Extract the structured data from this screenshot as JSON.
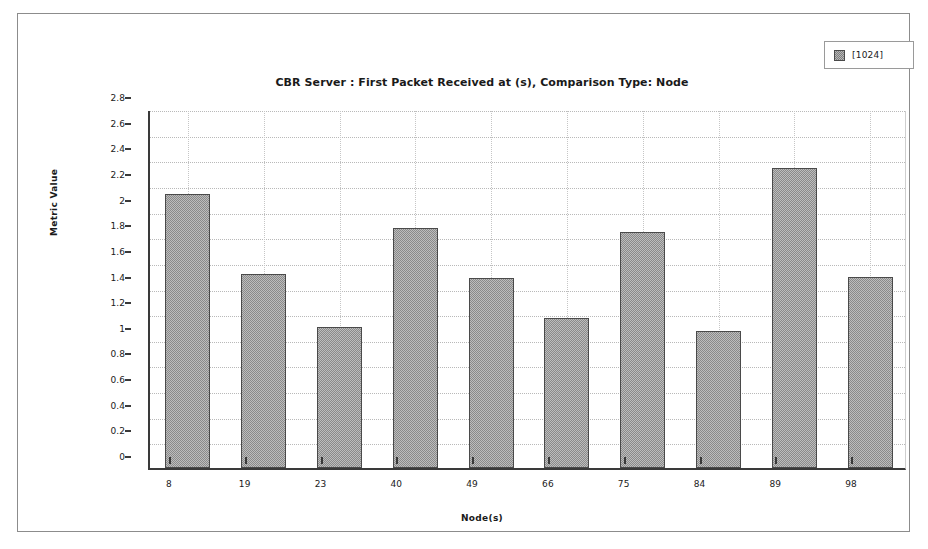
{
  "chart_data": {
    "type": "bar",
    "title": "CBR Server :  First Packet Received at (s), Comparison Type: Node",
    "xlabel": "Node(s)",
    "ylabel": "Metric Value",
    "categories": [
      "8",
      "19",
      "23",
      "40",
      "49",
      "66",
      "75",
      "84",
      "89",
      "98"
    ],
    "values": [
      2.14,
      1.51,
      1.1,
      1.87,
      1.48,
      1.17,
      1.84,
      1.07,
      2.34,
      1.49
    ],
    "series": [
      {
        "name": "[1024]",
        "values": [
          2.14,
          1.51,
          1.1,
          1.87,
          1.48,
          1.17,
          1.84,
          1.07,
          2.34,
          1.49
        ]
      }
    ],
    "ylim": [
      0,
      2.8
    ],
    "ytick_labels": [
      "0",
      "0.2",
      "0.4",
      "0.6",
      "0.8",
      "1",
      "1.2",
      "1.4",
      "1.6",
      "1.8",
      "2",
      "2.2",
      "2.4",
      "2.6",
      "2.8"
    ],
    "ytick_values": [
      0,
      0.2,
      0.4,
      0.6,
      0.8,
      1,
      1.2,
      1.4,
      1.6,
      1.8,
      2,
      2.2,
      2.4,
      2.6,
      2.8
    ],
    "grid": true,
    "legend_position": "top-right",
    "bar_color": "#bdbdbd",
    "bar_border_color": "#4a4a4a",
    "grid_color": "#b9b9b9",
    "axis_color": "#3a3a3a"
  },
  "legend": {
    "entries": [
      {
        "label": "[1024]",
        "swatch_color": "#bdbdbd"
      }
    ]
  }
}
